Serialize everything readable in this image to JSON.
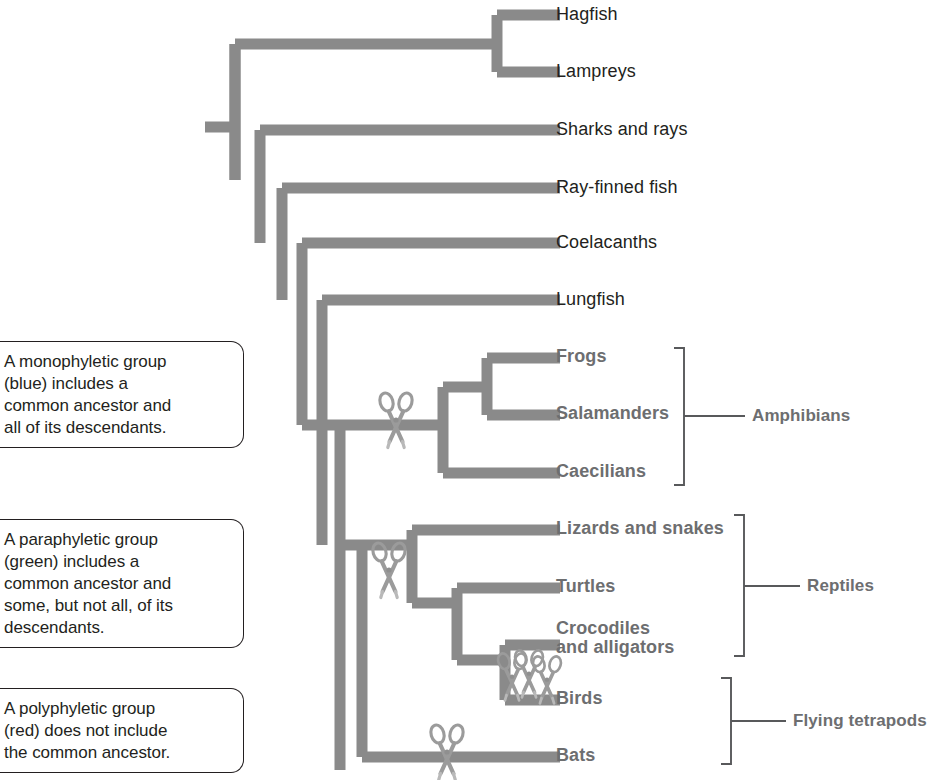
{
  "figure": {
    "type": "phylogenetic-tree",
    "branch_color": "#8a8a8a",
    "label_color": "#231f20",
    "group_label_color": "#6d6e70",
    "cut_marker_icon": "scissors-icon",
    "cut_marker_count": 6
  },
  "taxa": [
    {
      "id": "hagfish",
      "label": "Hagfish",
      "style": "plain",
      "y": 15
    },
    {
      "id": "lampreys",
      "label": "Lampreys",
      "style": "plain",
      "y": 72
    },
    {
      "id": "sharks",
      "label": "Sharks and rays",
      "style": "plain",
      "y": 130
    },
    {
      "id": "rayfinned",
      "label": "Ray-finned fish",
      "style": "plain",
      "y": 188
    },
    {
      "id": "coelacanths",
      "label": "Coelacanths",
      "style": "plain",
      "y": 243
    },
    {
      "id": "lungfish",
      "label": "Lungfish",
      "style": "plain",
      "y": 300
    },
    {
      "id": "frogs",
      "label": "Frogs",
      "style": "bold",
      "y": 358
    },
    {
      "id": "salamanders",
      "label": "Salamanders",
      "style": "bold",
      "y": 415
    },
    {
      "id": "caecilians",
      "label": "Caecilians",
      "style": "bold",
      "y": 473
    },
    {
      "id": "lizards",
      "label": "Lizards and snakes",
      "style": "bold",
      "y": 530
    },
    {
      "id": "turtles",
      "label": "Turtles",
      "style": "bold",
      "y": 588
    },
    {
      "id": "crocodiles",
      "label": "Crocodiles\nand alligators",
      "style": "bold",
      "y": 637
    },
    {
      "id": "birds",
      "label": "Birds",
      "style": "bold",
      "y": 700
    },
    {
      "id": "bats",
      "label": "Bats",
      "style": "bold",
      "y": 757
    }
  ],
  "taxon_labels": {
    "hagfish": "Hagfish",
    "lampreys": "Lampreys",
    "sharks": "Sharks and rays",
    "rayfinned": "Ray-finned fish",
    "coelacanths": "Coelacanths",
    "lungfish": "Lungfish",
    "frogs": "Frogs",
    "salamanders": "Salamanders",
    "caecilians": "Caecilians",
    "lizards": "Lizards and snakes",
    "turtles": "Turtles",
    "crocodiles_line1": "Crocodiles",
    "crocodiles_line2": "and alligators",
    "birds": "Birds",
    "bats": "Bats"
  },
  "groups": [
    {
      "id": "amphibians",
      "label": "Amphibians",
      "members": [
        "frogs",
        "salamanders",
        "caecilians"
      ]
    },
    {
      "id": "reptiles",
      "label": "Reptiles",
      "members": [
        "lizards",
        "turtles",
        "crocodiles",
        "birds"
      ]
    },
    {
      "id": "flying_tetrapods",
      "label": "Flying tetrapods",
      "members": [
        "birds",
        "bats"
      ]
    }
  ],
  "group_labels": {
    "amphibians": "Amphibians",
    "reptiles": "Reptiles",
    "flying_tetrapods": "Flying tetrapods"
  },
  "callouts": {
    "monophyletic": {
      "line1": "A monophyletic group",
      "line2": "(blue) includes a",
      "line3": "common ancestor and",
      "line4": "all of its descendants.",
      "text": "A monophyletic group (blue) includes a common ancestor and all of its descendants."
    },
    "paraphyletic": {
      "line1": "A paraphyletic group",
      "line2": "(green) includes a",
      "line3": "common ancestor and",
      "line4": "some, but not all, of its",
      "line5": "descendants.",
      "text": "A paraphyletic group (green) includes a common ancestor and some, but not all, of its descendants."
    },
    "polyphyletic": {
      "line1": "A polyphyletic group",
      "line2": "(red) does not include",
      "line3": "the common ancestor.",
      "text": "A polyphyletic group (red) does not include the common ancestor."
    }
  }
}
